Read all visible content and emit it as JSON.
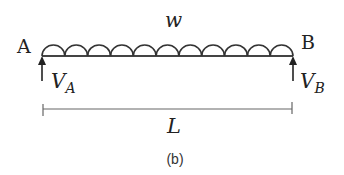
{
  "diagram": {
    "type": "simply-supported beam with uniformly distributed load",
    "labels": {
      "left_support": "A",
      "right_support": "B",
      "load": "w",
      "reaction_left_main": "V",
      "reaction_left_sub": "A",
      "reaction_right_main": "V",
      "reaction_right_sub": "B",
      "span": "L",
      "caption": "(b)"
    },
    "beam": {
      "x_start": 42,
      "x_end": 293,
      "y": 56
    },
    "load_loops": 11,
    "colors": {
      "stroke": "#333333",
      "text": "#222222",
      "dimension": "#666666"
    }
  }
}
